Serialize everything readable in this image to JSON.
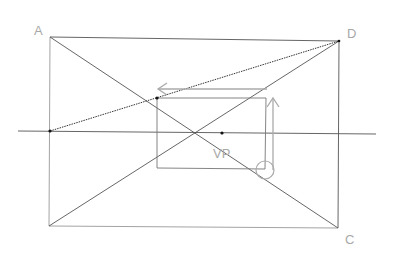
{
  "labels": {
    "corner_a": "A",
    "corner_d": "D",
    "corner_c": "C",
    "vanishing_point": "VP"
  },
  "colors": {
    "line": "#555555",
    "guide": "#a8a8a8",
    "label": "#a8a8a8",
    "point": "#111111"
  },
  "points": {
    "A": [
      50,
      37
    ],
    "D": [
      339,
      41
    ],
    "C": [
      338,
      228
    ],
    "B": [
      49,
      226
    ],
    "VP": [
      222,
      133
    ],
    "inner_tl": [
      157,
      98
    ],
    "inner_tr": [
      266,
      98
    ],
    "inner_bl": [
      157,
      168
    ],
    "inner_br": [
      265,
      169
    ],
    "horizon_left_point": [
      50,
      131
    ]
  },
  "horizon_line": {
    "x1": 18,
    "x2": 376,
    "y": 132
  }
}
